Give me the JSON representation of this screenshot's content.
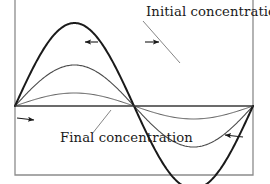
{
  "figure": {
    "background_color": "#ffffff",
    "width": 270,
    "height": 184
  },
  "frame": {
    "name": "plot-frame",
    "left_x": 15,
    "right_x": 253,
    "bottom_y": 175,
    "top_open": true,
    "color": "#8c8c8c",
    "stroke_width": 1.3
  },
  "axis": {
    "name": "zero-baseline",
    "y": 106,
    "x_start": 15,
    "x_end": 253,
    "color": "#3a3a3a",
    "stroke_width": 1.5
  },
  "labels": {
    "initial": {
      "text": "Initial concentration",
      "x": 146,
      "y": 16,
      "color": "#1a1a1a"
    },
    "final": {
      "text": "Final concentration",
      "x": 60,
      "y": 142,
      "color": "#1a1a1a"
    }
  },
  "leaders": [
    {
      "name": "leader-initial",
      "from_x": 143,
      "from_y": 21,
      "to_x": 180,
      "to_y": 63,
      "color": "#777777"
    },
    {
      "name": "leader-final",
      "from_x": 111,
      "from_y": 110,
      "to_x": 92,
      "to_y": 134,
      "color": "#777777"
    }
  ],
  "arrows": [
    {
      "name": "arrow-peak-left-outward",
      "direction": "left",
      "tail_x": 98,
      "tail_y": 42,
      "head_x": 85,
      "head_y": 42,
      "color": "#1a1a1a"
    },
    {
      "name": "arrow-peak-right-outward",
      "direction": "right",
      "tail_x": 145,
      "tail_y": 42,
      "head_x": 159,
      "head_y": 42,
      "color": "#1a1a1a"
    },
    {
      "name": "arrow-left-trough-inward",
      "direction": "right",
      "tail_x": 17,
      "tail_y": 118,
      "head_x": 34,
      "head_y": 120,
      "color": "#1a1a1a"
    },
    {
      "name": "arrow-right-trough-inward",
      "direction": "left",
      "tail_x": 243,
      "tail_y": 137,
      "head_x": 225,
      "head_y": 135,
      "color": "#1a1a1a"
    }
  ],
  "chart_data": {
    "type": "line",
    "xlabel": "",
    "ylabel": "",
    "grid": false,
    "legend": "annotations",
    "xlim": [
      0,
      1
    ],
    "ylim": [
      -1,
      1
    ],
    "x_pixel_range": [
      15,
      253
    ],
    "baseline_pixel_y": 106,
    "annotations": [
      "Initial concentration",
      "Final concentration"
    ],
    "series": [
      {
        "name": "Initial concentration",
        "shape": "sine-one-period",
        "amplitude_normalized": 1.0,
        "amplitude_px": 83,
        "peak_pixel_y": 23,
        "trough_pixel_y": 163,
        "stroke_width": 2.0,
        "color": "#1a1a1a"
      },
      {
        "name": "Intermediate concentration",
        "shape": "sine-one-period",
        "amplitude_normalized": 0.5,
        "amplitude_px": 41,
        "peak_pixel_y": 65,
        "trough_pixel_y": 147,
        "stroke_width": 1.1,
        "color": "#4a4a4a"
      },
      {
        "name": "Final concentration",
        "shape": "sine-one-period",
        "amplitude_normalized": 0.16,
        "amplitude_px": 13,
        "peak_pixel_y": 93,
        "trough_pixel_y": 119,
        "stroke_width": 1.0,
        "color": "#5a5a5a"
      }
    ]
  }
}
